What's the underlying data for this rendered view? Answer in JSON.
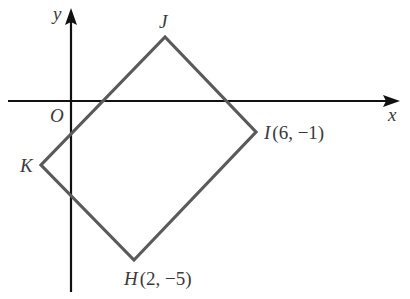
{
  "diagram": {
    "type": "coordinate-plane-quadrilateral",
    "axes": {
      "x_label": "x",
      "y_label": "y",
      "origin_label": "O",
      "color": "#111111"
    },
    "shape": {
      "name": "HIJK",
      "color": "#5a5a5a",
      "vertices": [
        {
          "name": "H",
          "coords": "(2,  −5)",
          "label": "H",
          "coord_text": "(2,  −5)"
        },
        {
          "name": "I",
          "coords": "(6,  −1)",
          "label": "I",
          "coord_text": "(6,  −1)"
        },
        {
          "name": "J",
          "label": "J",
          "coord_text": ""
        },
        {
          "name": "K",
          "label": "K",
          "coord_text": ""
        }
      ]
    }
  }
}
